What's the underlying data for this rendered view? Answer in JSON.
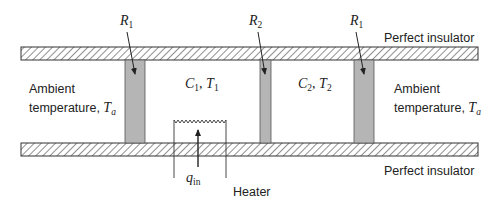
{
  "diagram": {
    "insulators": {
      "top_label": "Perfect insulator",
      "bottom_label": "Perfect insulator"
    },
    "resistances": [
      {
        "symbol": "R",
        "subscript": "1"
      },
      {
        "symbol": "R",
        "subscript": "2"
      },
      {
        "symbol": "R",
        "subscript": "1"
      }
    ],
    "chambers": [
      {
        "capacitance": "C",
        "cap_sub": "1",
        "sep": ", ",
        "temperature": "T",
        "temp_sub": "1"
      },
      {
        "capacitance": "C",
        "cap_sub": "2",
        "sep": ", ",
        "temperature": "T",
        "temp_sub": "2"
      }
    ],
    "ambient_left": {
      "line1": "Ambient",
      "line2": "temperature, ",
      "symbol": "T",
      "subscript": "a"
    },
    "ambient_right": {
      "line1": "Ambient",
      "line2": "temperature, ",
      "symbol": "T",
      "subscript": "a"
    },
    "heater": {
      "label": "Heater",
      "flow_symbol": "q",
      "flow_subscript": "in"
    },
    "colors": {
      "wall_fill": "#b5b5b5",
      "line": "#333333",
      "hatch": "#444444"
    }
  }
}
